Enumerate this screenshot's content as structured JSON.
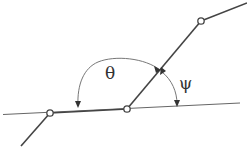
{
  "diagram": {
    "type": "geometry-angle-diagram",
    "labels": {
      "theta": "θ",
      "psi": "ψ"
    },
    "colors": {
      "line": "#444444",
      "thin_line": "#666666",
      "arc": "#777777",
      "node_fill": "#ffffff",
      "background": "#ffffff"
    },
    "nodes": [
      {
        "id": "A",
        "x": 50,
        "y": 113
      },
      {
        "id": "B",
        "x": 127,
        "y": 109
      },
      {
        "id": "C",
        "x": 201,
        "y": 21
      }
    ]
  }
}
